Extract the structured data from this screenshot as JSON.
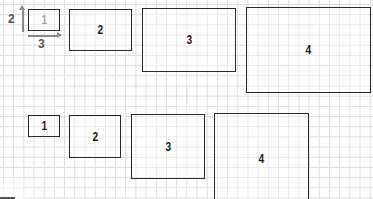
{
  "diagram": {
    "grid": {
      "spacing_px": 10,
      "line_color": "#dcdcdc"
    },
    "dimension_labels": {
      "height": "2",
      "width": "3"
    },
    "top_row": [
      {
        "label": "1",
        "style": "ghost",
        "x": 28,
        "y": 9,
        "w": 32,
        "h": 22
      },
      {
        "label": "2",
        "x": 69,
        "y": 9,
        "w": 63,
        "h": 42
      },
      {
        "label": "3",
        "x": 142,
        "y": 8,
        "w": 94,
        "h": 64
      },
      {
        "label": "4",
        "x": 246,
        "y": 7,
        "w": 125,
        "h": 86
      }
    ],
    "bottom_row": [
      {
        "label": "1",
        "x": 28,
        "y": 115,
        "w": 32,
        "h": 22
      },
      {
        "label": "2",
        "x": 69,
        "y": 115,
        "w": 52,
        "h": 43
      },
      {
        "label": "3",
        "x": 131,
        "y": 114,
        "w": 74,
        "h": 65
      },
      {
        "label": "4",
        "x": 214,
        "y": 113,
        "w": 95,
        "h": 90
      }
    ]
  }
}
